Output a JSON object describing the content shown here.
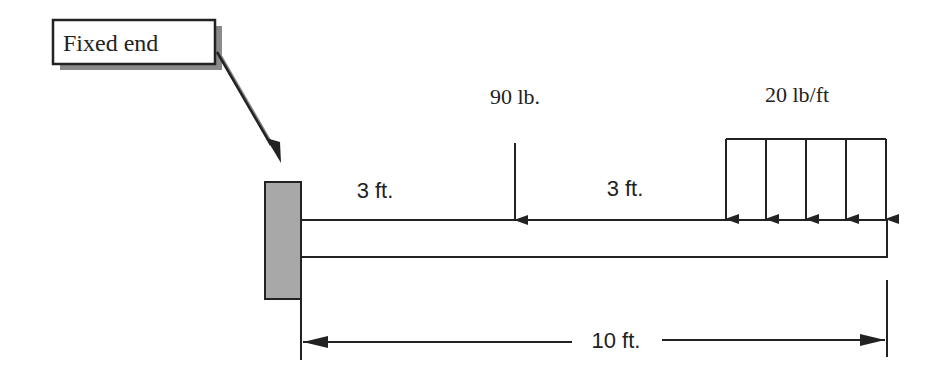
{
  "diagram": {
    "type": "cantilever-beam-load-diagram",
    "callout": {
      "label": "Fixed end"
    },
    "point_load": {
      "label": "90 lb.",
      "magnitude": 90,
      "unit": "lb"
    },
    "distributed_load": {
      "label": "20 lb/ft",
      "magnitude": 20,
      "unit": "lb/ft",
      "arrow_count": 5
    },
    "dimensions": {
      "segment_1": "3 ft.",
      "segment_2": "3 ft.",
      "total_length": "10 ft."
    },
    "colors": {
      "line": "#222222",
      "wall_fill": "#a8a8a8",
      "shadow": "#8a8a8a",
      "background": "#ffffff"
    }
  }
}
